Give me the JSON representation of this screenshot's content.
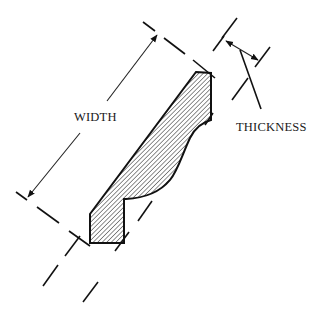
{
  "diagram": {
    "labels": {
      "width": "WIDTH",
      "thickness": "THICKNESS"
    },
    "colors": {
      "ink": "#111111",
      "background": "#ffffff",
      "hatch": "#333333"
    },
    "dimensions": [
      {
        "name": "width",
        "label": "WIDTH",
        "type": "double-arrow"
      },
      {
        "name": "thickness",
        "label": "THICKNESS",
        "type": "double-arrow-with-leader"
      }
    ],
    "fill_pattern": "diagonal-hatch"
  }
}
